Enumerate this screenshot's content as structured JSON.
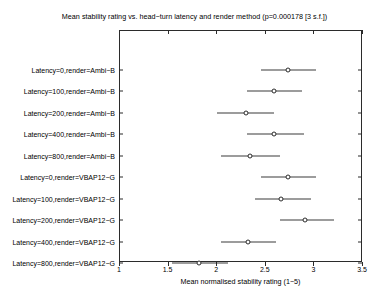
{
  "chart_data": {
    "type": "scatter",
    "title": "Mean stability rating vs. head−turn latency and render method (p=0.000178 [3 s.f.])",
    "xlabel": "Mean normalised stability rating (1−5)",
    "ylabel": "",
    "orientation": "horizontal",
    "grid": false,
    "legend": false,
    "xlim": [
      1,
      3.5
    ],
    "xticks": [
      "1",
      "1.5",
      "2",
      "2.5",
      "3",
      "3.5"
    ],
    "xtick_values": [
      1,
      1.5,
      2,
      2.5,
      3,
      3.5
    ],
    "categories": [
      "Latency=0,render=Ambi−B",
      "Latency=100,render=Ambi−B",
      "Latency=200,render=Ambi−B",
      "Latency=400,render=Ambi−B",
      "Latency=800,render=Ambi−B",
      "Latency=0,render=VBAP12−G",
      "Latency=100,render=VBAP12−G",
      "Latency=200,render=VBAP12−G",
      "Latency=400,render=VBAP12−G",
      "Latency=800,render=VBAP12−G"
    ],
    "series": [
      {
        "name": "Mean normalised stability rating",
        "values": [
          2.74,
          2.59,
          2.31,
          2.59,
          2.35,
          2.74,
          2.67,
          2.91,
          2.33,
          1.82
        ],
        "ci_low": [
          2.46,
          2.32,
          2.01,
          2.32,
          2.05,
          2.46,
          2.4,
          2.66,
          2.05,
          1.55
        ],
        "ci_high": [
          3.03,
          2.88,
          2.59,
          2.9,
          2.66,
          3.03,
          2.98,
          3.21,
          2.62,
          2.12
        ]
      }
    ],
    "colors": {
      "axis": "#2b2b2b",
      "marker_edge": "#2b2b2b",
      "marker_face": "#ffffff",
      "errorbar": "#3a3a3a",
      "background": "#ffffff"
    }
  }
}
